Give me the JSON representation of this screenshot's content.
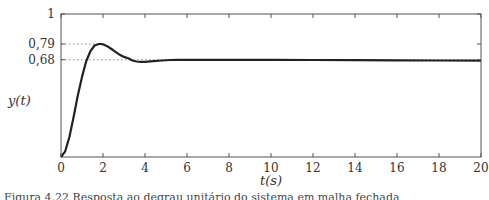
{
  "chart_data": {
    "type": "line",
    "title": "",
    "xlabel": "t(s)",
    "ylabel": "y(t)",
    "xlim": [
      0,
      20
    ],
    "ylim": [
      0,
      1
    ],
    "grid": false,
    "legend": null,
    "x_ticks": [
      "0",
      "2",
      "4",
      "6",
      "8",
      "10",
      "12",
      "14",
      "16",
      "18",
      "20"
    ],
    "y_ticks": [
      "0,68",
      "0,79",
      "1"
    ],
    "annotations": [
      {
        "type": "hline-dotted",
        "y": 0.79,
        "label": "0,79",
        "x_end": 1.9
      },
      {
        "type": "hline-dotted",
        "y": 0.68,
        "label": "0,68",
        "x_end": 20
      }
    ],
    "series": [
      {
        "name": "y(t)",
        "color": "#222222",
        "x": [
          0,
          0.2,
          0.4,
          0.6,
          0.8,
          1.0,
          1.2,
          1.4,
          1.6,
          1.8,
          1.9,
          2.0,
          2.2,
          2.4,
          2.6,
          2.8,
          3.0,
          3.2,
          3.4,
          3.6,
          3.8,
          4.0,
          4.4,
          4.8,
          5.2,
          5.6,
          6.0,
          7,
          8,
          10,
          12,
          14,
          16,
          18,
          20
        ],
        "values": [
          0,
          0.04,
          0.14,
          0.28,
          0.43,
          0.56,
          0.67,
          0.74,
          0.78,
          0.79,
          0.79,
          0.788,
          0.775,
          0.755,
          0.735,
          0.715,
          0.7,
          0.69,
          0.675,
          0.668,
          0.665,
          0.666,
          0.67,
          0.675,
          0.678,
          0.68,
          0.68,
          0.68,
          0.68,
          0.679,
          0.678,
          0.677,
          0.676,
          0.675,
          0.674
        ]
      }
    ]
  },
  "caption": "Figura 4.22 Resposta ao degrau unitário do sistema em malha fechada"
}
